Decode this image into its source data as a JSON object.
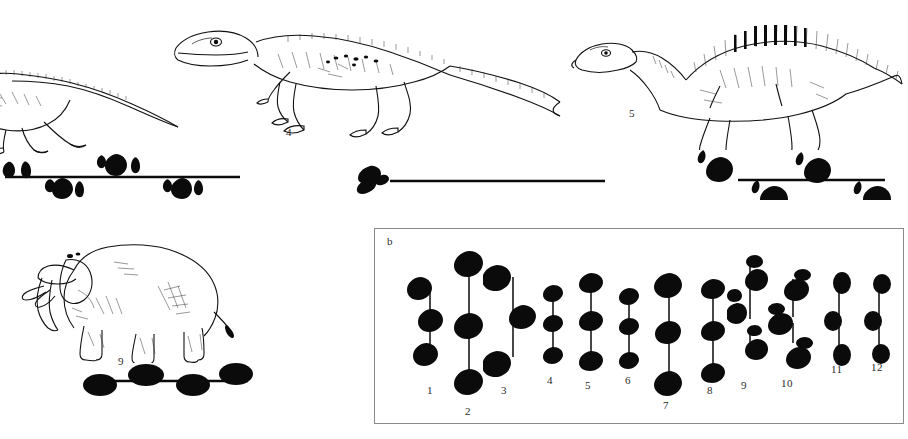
{
  "figure": {
    "type": "scientific-illustration",
    "background_color": "#ffffff",
    "ink_color": "#0b0b0b"
  },
  "panel_a": {
    "silhouettes": [
      {
        "id": "theropod-left",
        "name": "theropod-dinosaur-partial",
        "label": ""
      },
      {
        "id": "theropod-middle",
        "name": "large-theropod-dinosaur",
        "label": "4"
      },
      {
        "id": "hadrosaur-right",
        "name": "hadrosaur-dinosaur",
        "label": "5"
      },
      {
        "id": "elephant",
        "name": "elephant",
        "label": "9"
      }
    ],
    "trackways": [
      {
        "id": "trackway-theropod-left",
        "print_shape": "three-toed",
        "print_count": 6,
        "has_line": true
      },
      {
        "id": "trackway-theropod-middle",
        "print_shape": "three-toed",
        "print_count": 1,
        "has_line": true
      },
      {
        "id": "trackway-hadrosaur",
        "print_shape": "three-toed-with-manus",
        "print_count": 4,
        "has_line": true
      },
      {
        "id": "trackway-elephant",
        "print_shape": "oval",
        "print_count": 4,
        "has_line": true
      }
    ]
  },
  "panel_b": {
    "label": "b",
    "border_color": "#8a8a8a",
    "trackways": [
      {
        "label": "1",
        "print_shape": "three-toed",
        "prints": 3,
        "gauge": "narrow",
        "stride": "short"
      },
      {
        "label": "2",
        "print_shape": "three-toed",
        "prints": 3,
        "gauge": "narrow",
        "stride": "long"
      },
      {
        "label": "3",
        "print_shape": "three-toed",
        "prints": 3,
        "gauge": "wide",
        "stride": "medium"
      },
      {
        "label": "4",
        "print_shape": "three-toed",
        "prints": 3,
        "gauge": "narrow",
        "stride": "short"
      },
      {
        "label": "5",
        "print_shape": "three-toed",
        "prints": 3,
        "gauge": "narrow",
        "stride": "medium"
      },
      {
        "label": "6",
        "print_shape": "three-toed",
        "prints": 3,
        "gauge": "narrow",
        "stride": "short"
      },
      {
        "label": "7",
        "print_shape": "three-toed",
        "prints": 3,
        "gauge": "narrow",
        "stride": "long"
      },
      {
        "label": "8",
        "print_shape": "three-toed",
        "prints": 3,
        "gauge": "narrow",
        "stride": "long"
      },
      {
        "label": "9",
        "print_shape": "manus-pes-pairs",
        "prints": 6,
        "gauge": "wide",
        "stride": "medium"
      },
      {
        "label": "10",
        "print_shape": "manus-pes-pairs",
        "prints": 6,
        "gauge": "wide",
        "stride": "medium"
      },
      {
        "label": "11",
        "print_shape": "oval",
        "prints": 3,
        "gauge": "narrow",
        "stride": "medium"
      },
      {
        "label": "12",
        "print_shape": "oval",
        "prints": 3,
        "gauge": "narrow",
        "stride": "medium"
      }
    ]
  }
}
